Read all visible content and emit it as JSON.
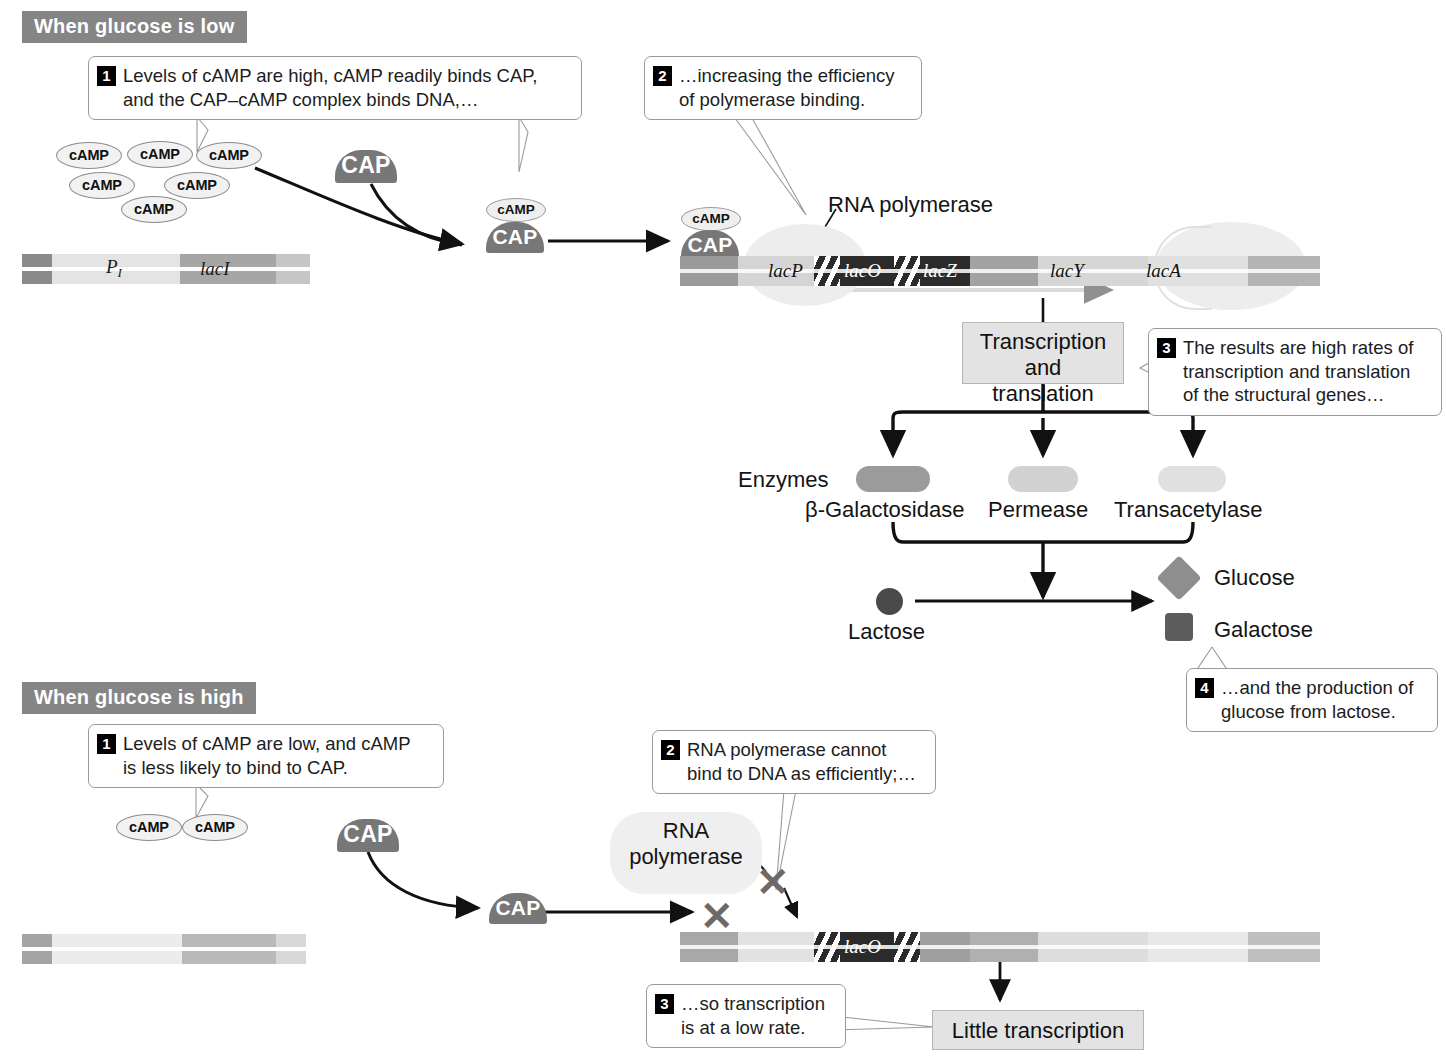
{
  "figure": {
    "title_top": "When glucose is low",
    "title_bottom": "When glucose is high"
  },
  "panel_low": {
    "banner": "When glucose is low",
    "callouts": [
      {
        "num": "1",
        "text": "Levels of cAMP are high, cAMP readily binds CAP,\nand the CAP–cAMP complex binds DNA,…"
      },
      {
        "num": "2",
        "text": "…increasing the efficiency\nof polymerase binding."
      },
      {
        "num": "3",
        "text": "The results are high rates of\ntranscription and translation\nof the  structural genes…"
      },
      {
        "num": "4",
        "text": "…and the production of\nglucose from lactose."
      }
    ],
    "camp_pool": [
      "cAMP",
      "cAMP",
      "cAMP",
      "cAMP",
      "cAMP",
      "cAMP"
    ],
    "cap_free_label": "CAP",
    "complex_1": {
      "top": "cAMP",
      "bottom": "CAP"
    },
    "complex_2": {
      "top": "cAMP",
      "bottom": "CAP"
    },
    "rna_polymerase_label": "RNA polymerase",
    "gene_i": {
      "promoter_label": "P",
      "promoter_sub": "I",
      "gene_label": "lacI"
    },
    "operon_labels": [
      "lacP",
      "lacO",
      "lacZ",
      "lacY",
      "lacA"
    ],
    "transcription_box": "Transcription\nand translation",
    "enzymes_label": "Enzymes",
    "enzyme_names": [
      "β-Galactosidase",
      "Permease",
      "Transacetylase"
    ],
    "lactose_label": "Lactose",
    "glucose_label": "Glucose",
    "galactose_label": "Galactose"
  },
  "panel_high": {
    "banner": "When glucose is high",
    "callouts": [
      {
        "num": "1",
        "text": "Levels of cAMP are low, and cAMP\nis less likely to bind to CAP."
      },
      {
        "num": "2",
        "text": "RNA polymerase cannot\nbind to DNA as efficiently;…"
      },
      {
        "num": "3",
        "text": "…so transcription\nis at a low rate."
      }
    ],
    "camp_pool": [
      "cAMP",
      "cAMP"
    ],
    "cap_free_label": "CAP",
    "cap_bound_label": "CAP",
    "rna_polymerase_label": "RNA\npolymerase",
    "operon_labels": [
      "lacO"
    ],
    "little_transcription_box": "Little transcription",
    "x_marks": [
      "✕",
      "✕"
    ]
  },
  "colors": {
    "banner_bg": "#858585",
    "cap_fill": "#777777",
    "camp_fill": "#f2f2f2",
    "operator_dark": "#2b2b2b",
    "gene_mid": "#9e9e9e",
    "gene_light": "#d9d9d9",
    "blob_fill": "#ededed",
    "box_fill": "#e3e3e3",
    "lactose": "#4a4a4a",
    "glucose": "#8e8e8e",
    "galactose": "#5d5d5d"
  }
}
